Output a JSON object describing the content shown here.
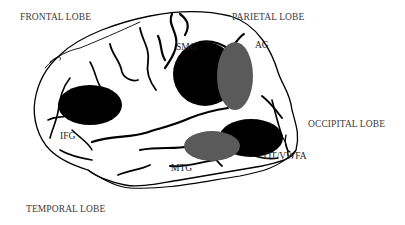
{
  "diagram": {
    "lobes": {
      "frontal": "FRONTAL LOBE",
      "parietal": "PARIETAL LOBE",
      "occipital": "OCCIPITAL LOBE",
      "temporal": "TEMPORAL LOBE"
    },
    "regions": {
      "smg": "SMG",
      "ag": "AG",
      "ifg": "IFG",
      "mtg": "MTG",
      "ot": "OT/VWFA"
    },
    "colors": {
      "black_region": "#000000",
      "gray_region": "#5a5a5a",
      "outline": "#000000",
      "label_text": "#3a3a3a"
    }
  }
}
